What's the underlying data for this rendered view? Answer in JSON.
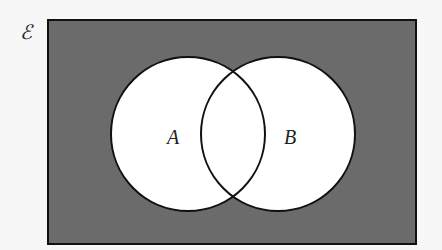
{
  "diagram": {
    "type": "venn",
    "universal_symbol": "ℰ",
    "sets": [
      {
        "label": "A",
        "cx": 188,
        "cy": 134,
        "r": 77
      },
      {
        "label": "B",
        "cx": 278,
        "cy": 134,
        "r": 77
      }
    ],
    "shaded_region": "complement of A ∪ B",
    "colors": {
      "background": "#f7f7f7",
      "universe_fill": "#6b6b6b",
      "set_fill": "#ffffff",
      "stroke": "#111111"
    }
  }
}
